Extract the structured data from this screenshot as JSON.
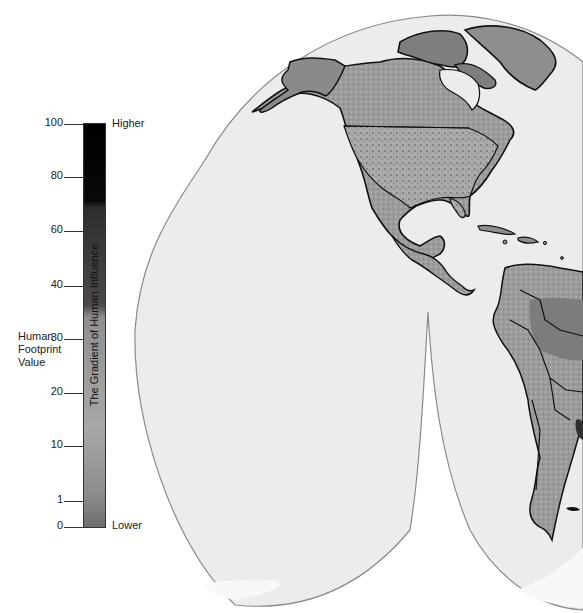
{
  "legend": {
    "title_lines": [
      "Human",
      "Footprint",
      "Value"
    ],
    "bar_caption": "The Gradient of Human Influence",
    "high_label": "Higher",
    "low_label": "Lower",
    "ticks": [
      {
        "value": "100",
        "y": 124
      },
      {
        "value": "80",
        "y": 177
      },
      {
        "value": "60",
        "y": 231
      },
      {
        "value": "40",
        "y": 286
      },
      {
        "value": "30",
        "y": 339
      },
      {
        "value": "20",
        "y": 393
      },
      {
        "value": "10",
        "y": 446
      },
      {
        "value": "1",
        "y": 501
      },
      {
        "value": "0",
        "y": 527
      }
    ],
    "gradient_stops": [
      {
        "offset": "0%",
        "color": "#000000"
      },
      {
        "offset": "19%",
        "color": "#080808"
      },
      {
        "offset": "21%",
        "color": "#2e2e2e"
      },
      {
        "offset": "45%",
        "color": "#4a4a4a"
      },
      {
        "offset": "48%",
        "color": "#8f8f8f"
      },
      {
        "offset": "75%",
        "color": "#a8a8a8"
      },
      {
        "offset": "92%",
        "color": "#8c8c8c"
      },
      {
        "offset": "100%",
        "color": "#6d6d6d"
      }
    ]
  },
  "map": {
    "projection_fill": "#ececec",
    "projection_stroke": "#8a8a8a",
    "land_fill": "#8e8e8e",
    "land_low_fill": "#7a7a7a",
    "urban_fill": "#3a3a3a",
    "border_color": "#111111",
    "ice_fill": "#f7f7f7",
    "regions": [
      "North America",
      "Greenland",
      "Central America",
      "Caribbean",
      "South America"
    ]
  }
}
